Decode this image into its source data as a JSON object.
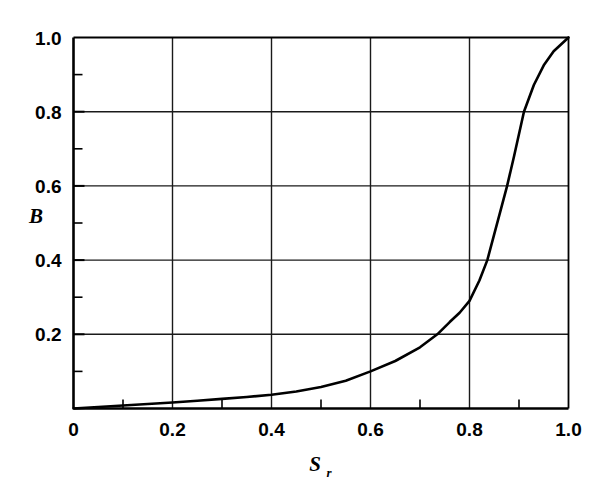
{
  "chart_data": {
    "type": "line",
    "title": "",
    "subtitle": "",
    "xlabel": "S",
    "xlabel_sub": "r",
    "ylabel": "B",
    "ylabel_sub": "",
    "xlim": [
      0,
      1.0
    ],
    "ylim": [
      0,
      1.0
    ],
    "grid": true,
    "grid_major_x": [
      0.2,
      0.4,
      0.6,
      0.8
    ],
    "grid_major_y": [
      0.2,
      0.4,
      0.6,
      0.8
    ],
    "minor_ticks_x": [
      0.1,
      0.3,
      0.5,
      0.7,
      0.9
    ],
    "minor_ticks_y": [
      0.1,
      0.3,
      0.5,
      0.7,
      0.9
    ],
    "xticks": [
      0,
      0.2,
      0.4,
      0.6,
      0.8,
      1.0
    ],
    "yticks": [
      0,
      0.2,
      0.4,
      0.6,
      0.8,
      1.0
    ],
    "xticklabels": [
      "0",
      "0.2",
      "0.4",
      "0.6",
      "0.8",
      "1.0"
    ],
    "yticklabels": [
      "",
      "0.2",
      "0.4",
      "0.6",
      "0.8",
      "1.0"
    ],
    "legend": null,
    "legend_position": "none",
    "series": [
      {
        "name": "B vs Sr",
        "color": "#000000",
        "linewidth": 2.6,
        "x": [
          0.0,
          0.05,
          0.1,
          0.15,
          0.2,
          0.25,
          0.3,
          0.35,
          0.4,
          0.45,
          0.5,
          0.55,
          0.6,
          0.65,
          0.7,
          0.735,
          0.76,
          0.78,
          0.8,
          0.82,
          0.836,
          0.85,
          0.86,
          0.876,
          0.89,
          0.91,
          0.93,
          0.95,
          0.97,
          1.0
        ],
        "y": [
          0.0,
          0.004,
          0.008,
          0.012,
          0.016,
          0.021,
          0.026,
          0.031,
          0.037,
          0.046,
          0.058,
          0.075,
          0.1,
          0.128,
          0.165,
          0.2,
          0.233,
          0.258,
          0.29,
          0.345,
          0.4,
          0.47,
          0.52,
          0.6,
          0.68,
          0.8,
          0.872,
          0.925,
          0.963,
          1.0
        ]
      }
    ]
  },
  "axes": {
    "y_title": "B",
    "x_title": "S",
    "x_title_subscript": "r"
  },
  "labels": {
    "y": [
      "1.0",
      "0.8",
      "0.6",
      "0.4",
      "0.2"
    ],
    "x": [
      "0",
      "0.2",
      "0.4",
      "0.6",
      "0.8",
      "1.0"
    ]
  },
  "colors": {
    "line": "#000000",
    "grid": "#1a1a1a",
    "axis": "#000000",
    "background": "#ffffff"
  }
}
